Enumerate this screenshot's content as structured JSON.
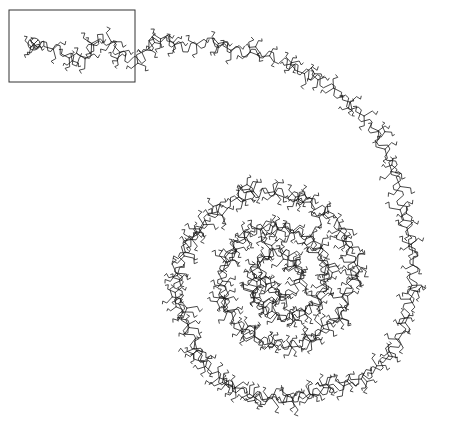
{
  "figure": {
    "type": "polymer-chain-conformation",
    "background": "#ffffff",
    "stroke_color": "#1a1a1a",
    "frame_color": "#333333",
    "inset_box": {
      "x": 9,
      "y": 10,
      "width": 126,
      "height": 72
    },
    "start_marker": {
      "symbol": "circle-x",
      "x": 34,
      "y": 44,
      "r": 6
    },
    "chain_path": [
      [
        34,
        44
      ],
      [
        60,
        50
      ],
      [
        80,
        62
      ],
      [
        100,
        38
      ],
      [
        122,
        55
      ],
      [
        140,
        60
      ],
      [
        158,
        38
      ],
      [
        185,
        48
      ],
      [
        212,
        42
      ],
      [
        240,
        52
      ],
      [
        268,
        55
      ],
      [
        295,
        68
      ],
      [
        322,
        82
      ],
      [
        345,
        100
      ],
      [
        365,
        120
      ],
      [
        380,
        140
      ],
      [
        393,
        165
      ],
      [
        398,
        190
      ],
      [
        405,
        215
      ],
      [
        412,
        240
      ],
      [
        414,
        265
      ],
      [
        412,
        290
      ],
      [
        405,
        315
      ],
      [
        398,
        340
      ],
      [
        385,
        360
      ],
      [
        368,
        375
      ],
      [
        345,
        385
      ],
      [
        318,
        392
      ],
      [
        295,
        398
      ],
      [
        270,
        398
      ],
      [
        245,
        392
      ],
      [
        222,
        380
      ],
      [
        205,
        362
      ],
      [
        192,
        340
      ],
      [
        182,
        315
      ],
      [
        178,
        290
      ],
      [
        180,
        265
      ],
      [
        190,
        242
      ],
      [
        205,
        222
      ],
      [
        225,
        205
      ],
      [
        250,
        195
      ],
      [
        275,
        192
      ],
      [
        300,
        198
      ],
      [
        322,
        210
      ],
      [
        340,
        228
      ],
      [
        350,
        250
      ],
      [
        352,
        275
      ],
      [
        345,
        300
      ],
      [
        332,
        322
      ],
      [
        312,
        338
      ],
      [
        290,
        345
      ],
      [
        266,
        342
      ],
      [
        245,
        330
      ],
      [
        230,
        312
      ],
      [
        222,
        290
      ],
      [
        224,
        268
      ],
      [
        234,
        248
      ],
      [
        252,
        232
      ],
      [
        274,
        226
      ],
      [
        296,
        230
      ],
      [
        314,
        244
      ],
      [
        324,
        264
      ],
      [
        324,
        285
      ],
      [
        314,
        305
      ],
      [
        296,
        316
      ],
      [
        274,
        316
      ],
      [
        258,
        302
      ],
      [
        252,
        282
      ],
      [
        258,
        262
      ],
      [
        275,
        252
      ],
      [
        293,
        258
      ],
      [
        300,
        276
      ],
      [
        292,
        292
      ],
      [
        276,
        296
      ],
      [
        270,
        280
      ]
    ],
    "motif": {
      "name": "pinwheel",
      "arms": 3,
      "arm_length": 9,
      "spacing": 15,
      "zigzag_amplitude": 4
    },
    "bottom_caption_clipped": "· · ·   ·   ·"
  }
}
